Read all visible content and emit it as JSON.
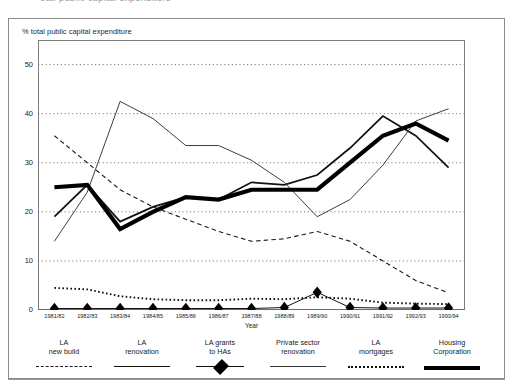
{
  "scan_caption": "otal public capital expenditure",
  "figure": {
    "y_axis_caption": "% total public capital expenditure",
    "x_axis_title": "Year"
  },
  "chart_data": {
    "type": "line",
    "title": "",
    "xlabel": "Year",
    "ylabel": "% total public capital expenditure",
    "ylim": [
      0,
      55
    ],
    "yticks": [
      0,
      10,
      20,
      30,
      40,
      50
    ],
    "ytick_labels": [
      "0",
      "10",
      "20",
      "30",
      "40",
      "50"
    ],
    "grid": true,
    "legend_position": "below-plot",
    "categories": [
      "1981/82",
      "1982/83",
      "1983/84",
      "1984/85",
      "1985/86",
      "1986/87",
      "1987/88",
      "1988/89",
      "1989/90",
      "1990/91",
      "1991/92",
      "1992/93",
      "1993/94"
    ],
    "series": [
      {
        "name": "LA\nnew build",
        "style": "dashed",
        "values": [
          35.5,
          30.0,
          24.5,
          21.0,
          18.5,
          16.0,
          14.0,
          14.5,
          16.0,
          14.0,
          10.0,
          6.0,
          3.5
        ]
      },
      {
        "name": "LA\nrenovation",
        "style": "solid-medium",
        "values": [
          19.0,
          25.5,
          18.0,
          21.0,
          23.0,
          22.5,
          26.0,
          25.5,
          27.5,
          33.0,
          39.5,
          35.5,
          29.0
        ]
      },
      {
        "name": "LA grants\nto HAs",
        "style": "diamond-marker",
        "values": [
          0.3,
          0.3,
          0.3,
          0.3,
          0.3,
          0.3,
          0.3,
          0.5,
          3.6,
          0.5,
          0.4,
          0.4,
          0.4
        ]
      },
      {
        "name": "Private sector\nrenovation",
        "style": "thin-solid",
        "values": [
          14.0,
          24.0,
          42.5,
          39.0,
          33.5,
          33.5,
          30.5,
          26.0,
          19.0,
          22.5,
          29.5,
          38.5,
          41.0
        ]
      },
      {
        "name": "LA\nmortgages",
        "style": "dotted",
        "values": [
          4.5,
          4.2,
          2.8,
          2.2,
          2.0,
          2.0,
          2.3,
          2.2,
          2.6,
          2.3,
          1.5,
          1.3,
          1.2
        ]
      },
      {
        "name": "Housing\nCorporation",
        "style": "thick-solid",
        "values": [
          25.0,
          25.5,
          16.5,
          20.0,
          23.0,
          22.5,
          24.5,
          24.5,
          24.5,
          30.0,
          35.5,
          38.0,
          34.5
        ]
      }
    ]
  }
}
